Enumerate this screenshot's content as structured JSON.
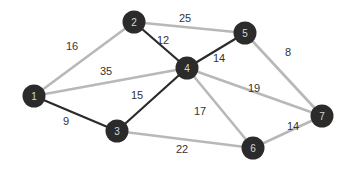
{
  "graph": {
    "colors": {
      "mst_edge": "#2a2a2a",
      "other_edge": "#b8b8b8",
      "node_fill": "#2b2b2b",
      "node_text": "#d8d8d8",
      "label_text": "#333333"
    },
    "nodes": [
      {
        "id": "1",
        "x": 34,
        "y": 96
      },
      {
        "id": "2",
        "x": 134,
        "y": 22
      },
      {
        "id": "3",
        "x": 117,
        "y": 131
      },
      {
        "id": "4",
        "x": 187,
        "y": 68
      },
      {
        "id": "5",
        "x": 245,
        "y": 33
      },
      {
        "id": "6",
        "x": 253,
        "y": 148
      },
      {
        "id": "7",
        "x": 322,
        "y": 116
      }
    ],
    "edges": [
      {
        "from": "1",
        "to": "2",
        "weight": "16",
        "highlighted": false,
        "lx": 72,
        "ly": 50
      },
      {
        "from": "1",
        "to": "4",
        "weight": "35",
        "highlighted": false,
        "lx": 106,
        "ly": 75
      },
      {
        "from": "2",
        "to": "5",
        "weight": "25",
        "highlighted": false,
        "lx": 185,
        "ly": 22
      },
      {
        "from": "2",
        "to": "4",
        "weight": "12",
        "highlighted": true,
        "lx": 163,
        "ly": 44
      },
      {
        "from": "4",
        "to": "5",
        "weight": "14",
        "highlighted": true,
        "lx": 219,
        "ly": 62
      },
      {
        "from": "5",
        "to": "7",
        "weight": "8",
        "highlighted": false,
        "lx": 288,
        "ly": 56
      },
      {
        "from": "4",
        "to": "7",
        "weight": "19",
        "highlighted": false,
        "lx": 254,
        "ly": 92
      },
      {
        "from": "1",
        "to": "3",
        "weight": "9",
        "highlighted": true,
        "lx": 66,
        "ly": 125
      },
      {
        "from": "3",
        "to": "4",
        "weight": "15",
        "highlighted": true,
        "lx": 137,
        "ly": 99
      },
      {
        "from": "4",
        "to": "6",
        "weight": "17",
        "highlighted": false,
        "lx": 200,
        "ly": 115
      },
      {
        "from": "3",
        "to": "6",
        "weight": "22",
        "highlighted": false,
        "lx": 182,
        "ly": 153
      },
      {
        "from": "6",
        "to": "7",
        "weight": "14",
        "highlighted": false,
        "lx": 293,
        "ly": 130
      }
    ]
  }
}
